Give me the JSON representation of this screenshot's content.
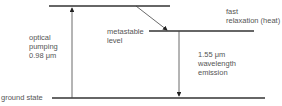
{
  "diagram": {
    "type": "energy-level diagram (erbium-doped fiber amplifier)",
    "levels": [
      {
        "id": "pump-level",
        "label": ""
      },
      {
        "id": "metastable-level",
        "label": "metastable\nlevel"
      },
      {
        "id": "ground-state",
        "label": "ground state"
      }
    ],
    "transitions": [
      {
        "id": "optical-pumping",
        "label": "optical\npumping\n0.98 μm",
        "from": "ground-state",
        "to": "pump-level",
        "direction": "up"
      },
      {
        "id": "fast-relaxation",
        "label": "fast\nrelaxation (heat)",
        "from": "pump-level",
        "to": "metastable-level",
        "direction": "down-diagonal"
      },
      {
        "id": "emission",
        "label": "1.55 μm\nwavelength\nemission",
        "from": "metastable-level",
        "to": "ground-state",
        "direction": "down"
      }
    ],
    "colors": {
      "line": "#222222",
      "arrow": "#333333",
      "text": "#555555"
    }
  }
}
